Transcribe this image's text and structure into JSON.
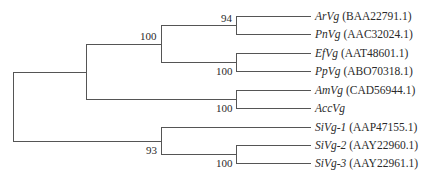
{
  "tree": {
    "type": "phylogenetic-tree",
    "line_color": "#555555",
    "leaves": [
      {
        "name": "ArVg",
        "accession": "(BAA22791.1)"
      },
      {
        "name": "PnVg",
        "accession": "(AAC32024.1)"
      },
      {
        "name": "EfVg",
        "accession": "(AAT48601.1)"
      },
      {
        "name": "PpVg",
        "accession": "(ABO70318.1)"
      },
      {
        "name": "AmVg",
        "accession": "(CAD56944.1)"
      },
      {
        "name": "AccVg",
        "accession": ""
      },
      {
        "name": "SiVg-1",
        "accession": "(AAP47155.1)"
      },
      {
        "name": "SiVg-2",
        "accession": "(AAY22960.1)"
      },
      {
        "name": "SiVg-3",
        "accession": "(AAY22961.1)"
      }
    ],
    "bootstrap": {
      "arvg_pnvg": "94",
      "arvg_pnvg_efvg_ppvg": "100",
      "efvg_ppvg": "100",
      "amvg_accvg": "100",
      "sivg_clade": "93",
      "sivg2_sivg3": "100"
    },
    "newick": "(((((ArVg,PnVg)94,(EfVg,PpVg)100)100,(AmVg,AccVg)100),(SiVg-1,(SiVg-2,SiVg-3)100)93);"
  }
}
